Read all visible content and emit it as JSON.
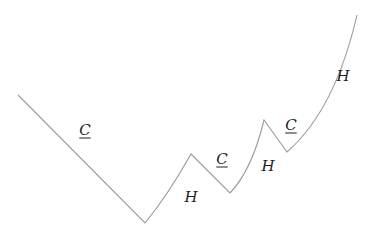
{
  "diagram": {
    "line_color": "#9a9a9a",
    "path": {
      "start": [
        18,
        95
      ],
      "segments": [
        {
          "type": "line",
          "to": [
            145,
            223
          ],
          "label": "C"
        },
        {
          "type": "curve",
          "ctrl": [
            168,
            195
          ],
          "to": [
            191,
            154
          ],
          "label": "H"
        },
        {
          "type": "line",
          "to": [
            230,
            193
          ],
          "label": "C"
        },
        {
          "type": "curve",
          "ctrl": [
            252,
            170
          ],
          "to": [
            264,
            120
          ],
          "label": "H"
        },
        {
          "type": "line",
          "to": [
            287,
            152
          ],
          "label": "C"
        },
        {
          "type": "curve",
          "ctrl": [
            335,
            110
          ],
          "to": [
            357,
            15
          ],
          "label": "H"
        }
      ]
    },
    "labels": [
      {
        "text": "C",
        "x": 85,
        "y": 130,
        "underlined": true
      },
      {
        "text": "H",
        "x": 191,
        "y": 197,
        "underlined": false
      },
      {
        "text": "C",
        "x": 222,
        "y": 159,
        "underlined": true
      },
      {
        "text": "H",
        "x": 268,
        "y": 166,
        "underlined": false
      },
      {
        "text": "C",
        "x": 291,
        "y": 125,
        "underlined": true
      },
      {
        "text": "H",
        "x": 343,
        "y": 76,
        "underlined": false
      }
    ]
  }
}
